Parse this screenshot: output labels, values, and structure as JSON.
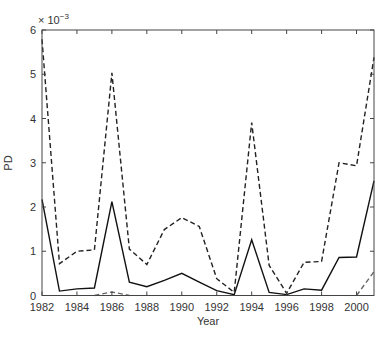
{
  "chart_data": {
    "type": "line",
    "title": "",
    "xlabel": "Year",
    "ylabel": "PD",
    "y_exponent_label": "× 10",
    "y_exponent_power": "−3",
    "xlim": [
      1982,
      2001
    ],
    "ylim": [
      0,
      6
    ],
    "grid": false,
    "legend": null,
    "x_ticks": [
      1982,
      1984,
      1986,
      1988,
      1990,
      1992,
      1994,
      1996,
      1998,
      2000
    ],
    "y_ticks": [
      0,
      1,
      2,
      3,
      4,
      5,
      6
    ],
    "x": [
      1982,
      1983,
      1984,
      1985,
      1986,
      1987,
      1988,
      1989,
      1990,
      1991,
      1992,
      1993,
      1994,
      1995,
      1996,
      1997,
      1998,
      1999,
      2000,
      2001
    ],
    "series": [
      {
        "name": "solid",
        "style": "solid",
        "color": "#111111",
        "values": [
          2.17,
          0.1,
          0.15,
          0.17,
          2.12,
          0.3,
          0.2,
          0.34,
          0.5,
          0.3,
          0.11,
          0.02,
          1.26,
          0.07,
          0.02,
          0.15,
          0.12,
          0.86,
          0.87,
          2.59
        ]
      },
      {
        "name": "dashed",
        "style": "dashed",
        "color": "#222222",
        "values": [
          5.79,
          0.72,
          1.0,
          1.03,
          5.03,
          1.05,
          0.7,
          1.49,
          1.76,
          1.56,
          0.38,
          0.07,
          3.91,
          0.68,
          0.05,
          0.75,
          0.77,
          3.0,
          2.93,
          5.38
        ]
      },
      {
        "name": "dashed-light",
        "style": "dashed",
        "color": "#666666",
        "values": [
          null,
          null,
          null,
          0.0,
          0.08,
          0.0,
          null,
          null,
          null,
          null,
          null,
          null,
          null,
          null,
          null,
          null,
          null,
          null,
          0.0,
          0.54
        ]
      }
    ]
  }
}
